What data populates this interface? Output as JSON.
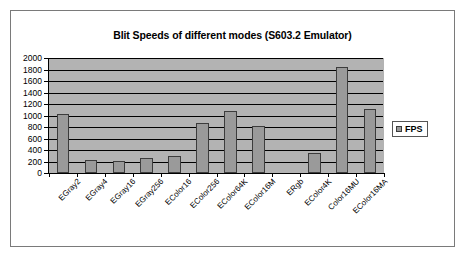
{
  "chart_data": {
    "type": "bar",
    "title": "Blit Speeds of different modes (S603.2 Emulator)",
    "xlabel": "",
    "ylabel": "",
    "ylim": [
      0,
      2000
    ],
    "ytick_step": 200,
    "yticks": [
      0,
      200,
      400,
      600,
      800,
      1000,
      1200,
      1400,
      1600,
      1800,
      2000
    ],
    "ytick_labels": [
      "0",
      "200",
      "400",
      "600",
      "800",
      "1000",
      "1200",
      "1400",
      "1600",
      "1800",
      "2000"
    ],
    "grid": true,
    "legend_position": "right",
    "legend": [
      "FPS"
    ],
    "categories": [
      "EGray2",
      "EGray4",
      "EGray16",
      "EGray256",
      "EColor16",
      "EColor256",
      "EColor64K",
      "EColor16M",
      "ERgb",
      "EColor4K",
      "Color16MU",
      "EColor16MA"
    ],
    "series": [
      {
        "name": "FPS",
        "values": [
          1020,
          230,
          215,
          260,
          290,
          870,
          1080,
          820,
          0,
          350,
          1840,
          1120
        ]
      }
    ],
    "colors": {
      "bar_fill": "#9a9a9a",
      "bar_border": "#3c3c3c",
      "plot_background": "#b3b3b3",
      "gridline": "#000000",
      "chart_background": "#ffffff",
      "frame_border": "#7a7a7a",
      "text": "#000000"
    }
  }
}
